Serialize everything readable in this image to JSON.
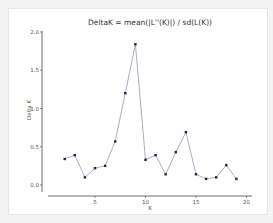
{
  "chart_data": {
    "type": "line",
    "title": "DeltaK = mean(|L''(K)|) / sd(L(K))",
    "xlabel": "K",
    "ylabel": "Delta K",
    "x": [
      2,
      3,
      4,
      5,
      6,
      7,
      8,
      9,
      10,
      11,
      12,
      13,
      14,
      15,
      16,
      17,
      18,
      19
    ],
    "series": [
      {
        "name": "Delta K",
        "values": [
          0.34,
          0.39,
          0.1,
          0.22,
          0.25,
          0.57,
          1.2,
          1.84,
          0.33,
          0.39,
          0.14,
          0.43,
          0.69,
          0.14,
          0.08,
          0.1,
          0.26,
          0.08
        ],
        "color": "#1f1f5c",
        "marker": "square"
      }
    ],
    "xticks": [
      "5",
      "10",
      "15",
      "20"
    ],
    "yticks": [
      "0.0",
      "0.5",
      "1.0",
      "1.5",
      "2.0"
    ],
    "xlim": [
      1,
      20.5
    ],
    "ylim": [
      -0.1,
      2.0
    ],
    "grid": false,
    "legend": null
  }
}
